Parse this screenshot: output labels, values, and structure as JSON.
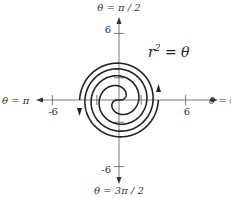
{
  "chart_data": {
    "type": "line",
    "title": "",
    "equation": "r^2 = θ",
    "equation_label": {
      "base": "r",
      "exp": "2",
      "rest": " = θ"
    },
    "coordinate_system": "polar",
    "theta_range": [
      0,
      12.566
    ],
    "branches": [
      "r = +sqrt(theta)",
      "r = -sqrt(theta)"
    ],
    "axes": {
      "x_ticks": [
        -6,
        6
      ],
      "y_ticks": [
        6,
        -6
      ],
      "x_tick_labels": [
        "-6",
        "6"
      ],
      "y_tick_labels": [
        "6",
        "-6"
      ],
      "minor_ticks_units": [
        -2,
        2
      ],
      "direction_labels": {
        "right": "θ = 0",
        "top": "θ = π / 2",
        "left": "θ = π",
        "bottom": "θ = 3π / 2"
      }
    },
    "center_px": [
      119,
      100
    ],
    "px_per_unit": 11.1,
    "grid": false,
    "legend": "none",
    "stroke_color": "#222222"
  }
}
